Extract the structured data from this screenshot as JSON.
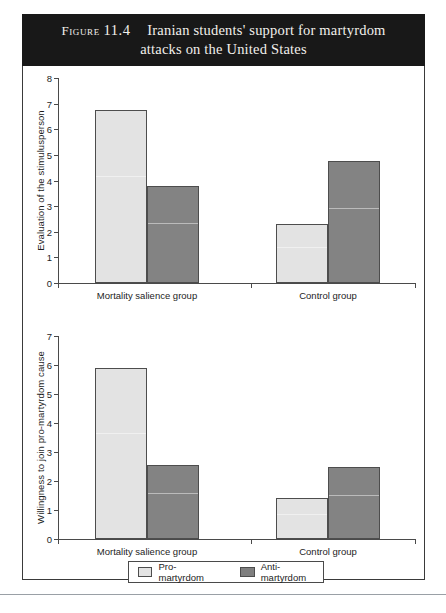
{
  "figure": {
    "label": "Figure",
    "number": "11.4",
    "title_line1": "Iranian students' support for martyrdom",
    "title_line2": "attacks on the United States",
    "banner_color": "#181818",
    "banner_text_color": "#f2f0ec"
  },
  "legend": {
    "position": "bottom-center",
    "entries": [
      {
        "label": "Pro-martyrdom",
        "color": "#e3e3e3",
        "swatch": "light-swatch"
      },
      {
        "label": "Anti-martyrdom",
        "color": "#7f7f7f",
        "swatch": "dark-swatch"
      }
    ]
  },
  "caption": {
    "text": ""
  },
  "chart_data": [
    {
      "type": "bar",
      "id": "evaluation-chart",
      "title": "",
      "xlabel": "",
      "ylabel": "Evaluation of the stimulusperson",
      "categories": [
        "Mortality salience group",
        "Control group"
      ],
      "ylim": [
        0,
        8
      ],
      "yticks": [
        0,
        1,
        2,
        3,
        4,
        5,
        6,
        7,
        8
      ],
      "ytick_labels": [
        "0",
        "1",
        "2",
        "3",
        "4",
        "5",
        "6",
        "7",
        "8"
      ],
      "grid": false,
      "legend_position": "figure-bottom",
      "series": [
        {
          "name": "Pro-martyrdom",
          "color": "#e3e3e3",
          "values": [
            6.75,
            2.3
          ]
        },
        {
          "name": "Anti-martyrdom",
          "color": "#838383",
          "values": [
            3.8,
            4.75
          ]
        }
      ]
    },
    {
      "type": "bar",
      "id": "willingness-chart",
      "title": "",
      "xlabel": "",
      "ylabel": "Willingness to join pro-martyrdom cause",
      "categories": [
        "Mortality salience group",
        "Control group"
      ],
      "ylim": [
        0,
        7
      ],
      "yticks": [
        0,
        1,
        2,
        3,
        4,
        5,
        6,
        7
      ],
      "ytick_labels": [
        "0",
        "1",
        "2",
        "3",
        "4",
        "5",
        "6",
        "7"
      ],
      "grid": false,
      "legend_position": "figure-bottom",
      "series": [
        {
          "name": "Pro-martyrdom",
          "color": "#e3e3e3",
          "values": [
            5.9,
            1.4
          ]
        },
        {
          "name": "Anti-martyrdom",
          "color": "#838383",
          "values": [
            2.55,
            2.48
          ]
        }
      ]
    }
  ]
}
